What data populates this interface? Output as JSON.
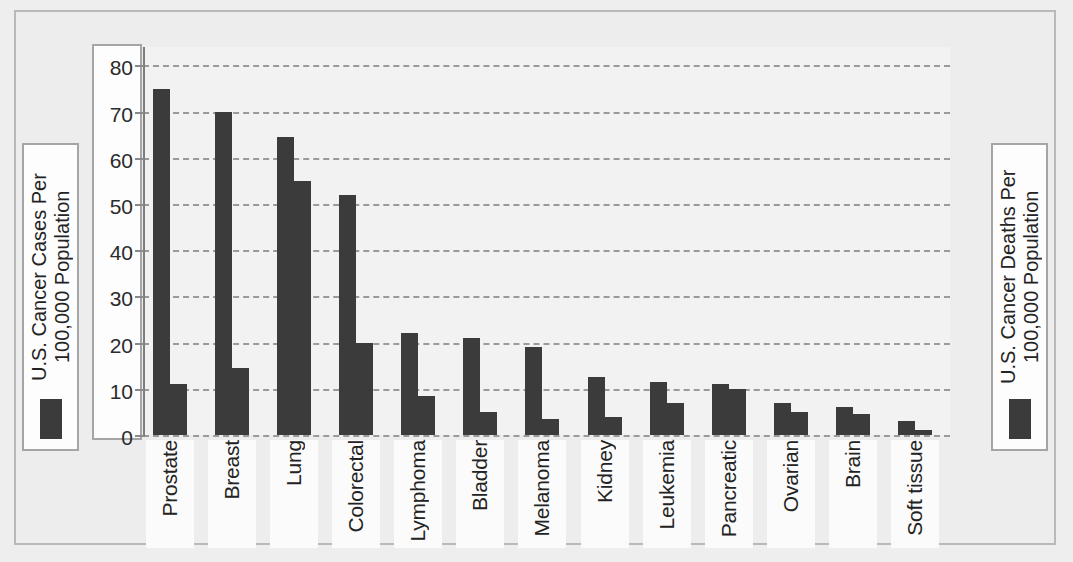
{
  "chart_data": {
    "type": "bar",
    "title": "",
    "xlabel": "",
    "ylabel": "U.S. Cancer Cases Per 100,000 Population",
    "ylim": [
      0,
      84
    ],
    "yticks": [
      0,
      10,
      20,
      30,
      40,
      50,
      60,
      70,
      80
    ],
    "grid": true,
    "legend_position": "outside-left-and-right",
    "categories": [
      "Prostate",
      "Breast",
      "Lung",
      "Colorectal",
      "Lymphoma",
      "Bladder",
      "Melanoma",
      "Kidney",
      "Leukemia",
      "Pancreatic",
      "Ovarian",
      "Brain",
      "Soft tissue"
    ],
    "series": [
      {
        "name": "U.S. Cancer Cases Per 100,000 Population",
        "values": [
          75,
          70,
          64.5,
          52,
          22,
          21,
          19,
          12.5,
          11.5,
          11,
          7,
          6,
          3
        ]
      },
      {
        "name": "U.S. Cancer Deaths Per 100,000 Population",
        "values": [
          11,
          14.5,
          55,
          20,
          8.5,
          5,
          3.5,
          4,
          7,
          10,
          5,
          4.5,
          1
        ]
      }
    ]
  },
  "axis": {
    "tick_labels": [
      "80",
      "70",
      "60",
      "50",
      "40",
      "30",
      "20",
      "10",
      "0"
    ]
  },
  "legend_left": {
    "label": "U.S. Cancer Cases Per 100,000 Population"
  },
  "legend_right": {
    "label": "U.S. Cancer Deaths Per 100,000 Population"
  },
  "colors": {
    "bar": "#3b3b3b",
    "plot_background": "#f2f2f2",
    "page_background": "#ededed",
    "grid": "#9a9a9a",
    "frame": "#b9b9b9"
  }
}
